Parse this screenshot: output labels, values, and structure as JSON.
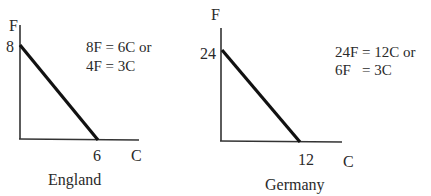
{
  "panels": [
    {
      "country": "England",
      "y_axis_label": "F",
      "x_axis_label": "C",
      "y_intercept_label": "8",
      "x_intercept_label": "6",
      "y_intercept": 8,
      "x_intercept": 6,
      "equation_line1": "8F = 6C or",
      "equation_line2": "4F = 3C"
    },
    {
      "country": "Germany",
      "y_axis_label": "F",
      "x_axis_label": "C",
      "y_intercept_label": "24",
      "x_intercept_label": "12",
      "y_intercept": 24,
      "x_intercept": 12,
      "equation_line1": "24F = 12C or",
      "equation_line2": "6F   = 3C"
    }
  ],
  "colors": {
    "line": "#111111",
    "axis": "#333333",
    "text": "#2a2a2a"
  }
}
